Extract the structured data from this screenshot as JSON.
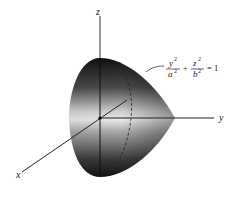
{
  "figure": {
    "axes": {
      "x_label": "x",
      "y_label": "y",
      "z_label": "z"
    },
    "annotation": {
      "y_num": "y",
      "y_exp": "2",
      "a_den": "a",
      "a_exp": "2",
      "plus": "+",
      "z_num": "z",
      "z_exp": "2",
      "b_den": "b",
      "b_exp": "2",
      "equals": "= 1",
      "full_text": "y^2/a^2 + z^2/b^2 = 1"
    },
    "colors": {
      "surface_dark": "#1a1a1a",
      "surface_light": "#e6e6e6",
      "axis": "#222222",
      "background": "#ffffff"
    }
  }
}
